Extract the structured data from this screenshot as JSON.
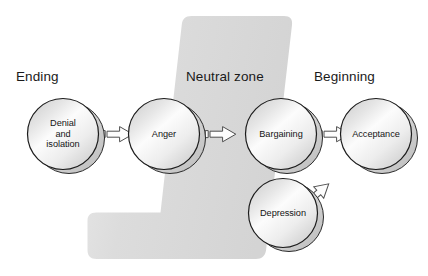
{
  "diagram": {
    "background_color": "#ffffff",
    "band": {
      "name": "neutral-zone-band",
      "fill_from": "#d9d9d9",
      "fill_to": "#ebebeb"
    },
    "zone_labels": [
      {
        "id": "ending",
        "text": "Ending"
      },
      {
        "id": "neutral",
        "text": "Neutral zone"
      },
      {
        "id": "beginning",
        "text": "Beginning"
      }
    ],
    "nodes": [
      {
        "id": "denial",
        "label": "Denial\nand\nisolation",
        "cx": 63,
        "cy": 134,
        "r": 36
      },
      {
        "id": "anger",
        "label": "Anger",
        "cx": 164,
        "cy": 134,
        "r": 36
      },
      {
        "id": "bargaining",
        "label": "Bargaining",
        "cx": 281,
        "cy": 134,
        "r": 36
      },
      {
        "id": "acceptance",
        "label": "Acceptance",
        "cx": 376,
        "cy": 134,
        "r": 36
      },
      {
        "id": "depression",
        "label": "Depression",
        "cx": 283,
        "cy": 213,
        "r": 35
      }
    ],
    "arrows": [
      {
        "id": "denial-to-anger",
        "from": "denial",
        "to": "anger"
      },
      {
        "id": "anger-to-bargaining",
        "from": "anger",
        "to": "bargaining"
      },
      {
        "id": "bargaining-to-acceptance",
        "from": "bargaining",
        "to": "acceptance"
      },
      {
        "id": "depression-to-acceptance",
        "from": "depression",
        "to": "acceptance"
      }
    ],
    "colors": {
      "sphere_outline": "#1c1c1c",
      "sphere_light": "#fbfbfb",
      "sphere_mid": "#e3e3e3",
      "sphere_shade": "#bdbdbd",
      "arrow_outline": "#4a4a4a",
      "arrow_fill": "#fdfdfd",
      "text": "#141414"
    }
  }
}
